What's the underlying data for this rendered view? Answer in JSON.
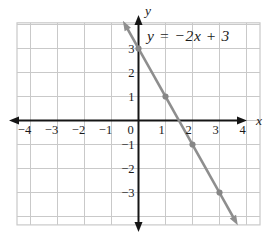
{
  "chart_data": {
    "type": "line",
    "title": "y = −2x + 3",
    "equation_label": "y = −2x + 3",
    "x_axis_label": "x",
    "y_axis_label": "y",
    "origin_label": "0",
    "slope": -2,
    "y_intercept": 3,
    "x_intercept": 1.5,
    "x_ticks": [
      {
        "v": -4,
        "t": "−4"
      },
      {
        "v": -3,
        "t": "−3"
      },
      {
        "v": -2,
        "t": "−2"
      },
      {
        "v": -1,
        "t": "−1"
      },
      {
        "v": 1,
        "t": "1"
      },
      {
        "v": 2,
        "t": "2"
      },
      {
        "v": 3,
        "t": "3"
      },
      {
        "v": 4,
        "t": "4"
      }
    ],
    "y_ticks": [
      {
        "v": 3,
        "t": "3"
      },
      {
        "v": 2,
        "t": "2"
      },
      {
        "v": 1,
        "t": "1"
      },
      {
        "v": -1,
        "t": "−1"
      },
      {
        "v": -2,
        "t": "−2"
      },
      {
        "v": -3,
        "t": "−3"
      }
    ],
    "points": [
      [
        0,
        3
      ],
      [
        1,
        1
      ],
      [
        2,
        -1
      ],
      [
        3,
        -3
      ]
    ],
    "line_ends": [
      [
        -0.47,
        3.94
      ],
      [
        3.57,
        -4.15
      ]
    ],
    "x_range": [
      -4.5,
      4.5
    ],
    "y_range": [
      -4.35,
      4.07
    ],
    "grid": true,
    "axes_arrows": true,
    "legend": "none",
    "colors": {
      "background": "#ffffff",
      "grid": "#c9c9c9",
      "axis": "#151515",
      "line": "#8e8e8e",
      "point": "#868686",
      "text": "#1a1a1a"
    }
  }
}
